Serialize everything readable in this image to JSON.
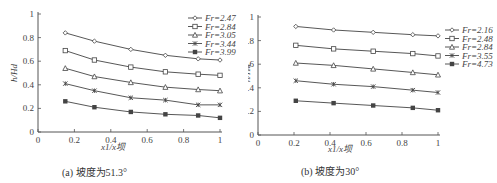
{
  "chart_data": [
    {
      "type": "line",
      "caption": "(a) 坡度为51.3°",
      "xlabel": "x1/x坝",
      "ylabel": "h/Hd",
      "xlim": [
        0,
        1
      ],
      "ylim": [
        0,
        1
      ],
      "xticks": [
        "0",
        "0.2",
        "0.4",
        "0.6",
        "0.8",
        "1"
      ],
      "yticks": [
        "0",
        "0.2",
        "0.4",
        "0.6",
        "0.8",
        "1"
      ],
      "grid": false,
      "legend_position": "upper right",
      "x": [
        0.15,
        0.31,
        0.51,
        0.7,
        0.88,
        1.0
      ],
      "series": [
        {
          "name": "Fr=2.47",
          "marker": "diamond",
          "values": [
            0.84,
            0.77,
            0.7,
            0.65,
            0.62,
            0.61
          ]
        },
        {
          "name": "Fr=2.84",
          "marker": "square-open",
          "values": [
            0.69,
            0.61,
            0.55,
            0.51,
            0.49,
            0.48
          ]
        },
        {
          "name": "Fr=3.05",
          "marker": "triangle",
          "values": [
            0.54,
            0.47,
            0.42,
            0.38,
            0.36,
            0.35
          ]
        },
        {
          "name": "Fr=3.44",
          "marker": "cross",
          "values": [
            0.41,
            0.35,
            0.29,
            0.27,
            0.23,
            0.23
          ]
        },
        {
          "name": "Fr=3.99",
          "marker": "square-filled",
          "values": [
            0.26,
            0.21,
            0.17,
            0.15,
            0.14,
            0.12
          ]
        }
      ]
    },
    {
      "type": "line",
      "caption": "(b) 坡度为30°",
      "xlabel": "x1/x坝",
      "ylabel": "h/Hd",
      "xlim": [
        0,
        1
      ],
      "ylim": [
        0,
        1
      ],
      "xticks": [
        "0",
        "0.2",
        "0.4",
        "0.6",
        "0.8",
        "1"
      ],
      "yticks": [
        "0",
        "0.2",
        "0.4",
        "0.6",
        "0.8",
        "1"
      ],
      "grid": false,
      "legend_position": "right",
      "x": [
        0.21,
        0.42,
        0.64,
        0.86,
        1.0
      ],
      "series": [
        {
          "name": "Fr=2.16",
          "marker": "diamond",
          "values": [
            0.92,
            0.89,
            0.87,
            0.85,
            0.84
          ]
        },
        {
          "name": "Fr=2.48",
          "marker": "square-open",
          "values": [
            0.76,
            0.73,
            0.71,
            0.69,
            0.67
          ]
        },
        {
          "name": "Fr=2.84",
          "marker": "triangle",
          "values": [
            0.61,
            0.59,
            0.56,
            0.53,
            0.51
          ]
        },
        {
          "name": "Fr=3.55",
          "marker": "cross",
          "values": [
            0.46,
            0.43,
            0.41,
            0.38,
            0.36
          ]
        },
        {
          "name": "Fr=4.73",
          "marker": "square-filled",
          "values": [
            0.29,
            0.27,
            0.25,
            0.23,
            0.21
          ]
        }
      ]
    }
  ],
  "layout": [
    {
      "x0": 38,
      "x1": 220,
      "y0": 132,
      "y1": 14,
      "legend_x": 188,
      "legend_y": 18,
      "caption_x": 62,
      "caption_y": 164,
      "xlabel_x": 113,
      "xlabel_y": 150,
      "ylabel_x": 9,
      "ylabel_y": 73
    },
    {
      "x0": 10,
      "x1": 190,
      "y0": 135,
      "y1": 17,
      "legend_x": 197,
      "legend_y": 30,
      "caption_x": 53,
      "caption_y": 163,
      "xlabel_x": 92,
      "xlabel_y": 152,
      "ylabel_x": -6,
      "ylabel_y": 73
    }
  ],
  "style": {
    "line_color": "#444444",
    "axis_color": "#555555"
  }
}
